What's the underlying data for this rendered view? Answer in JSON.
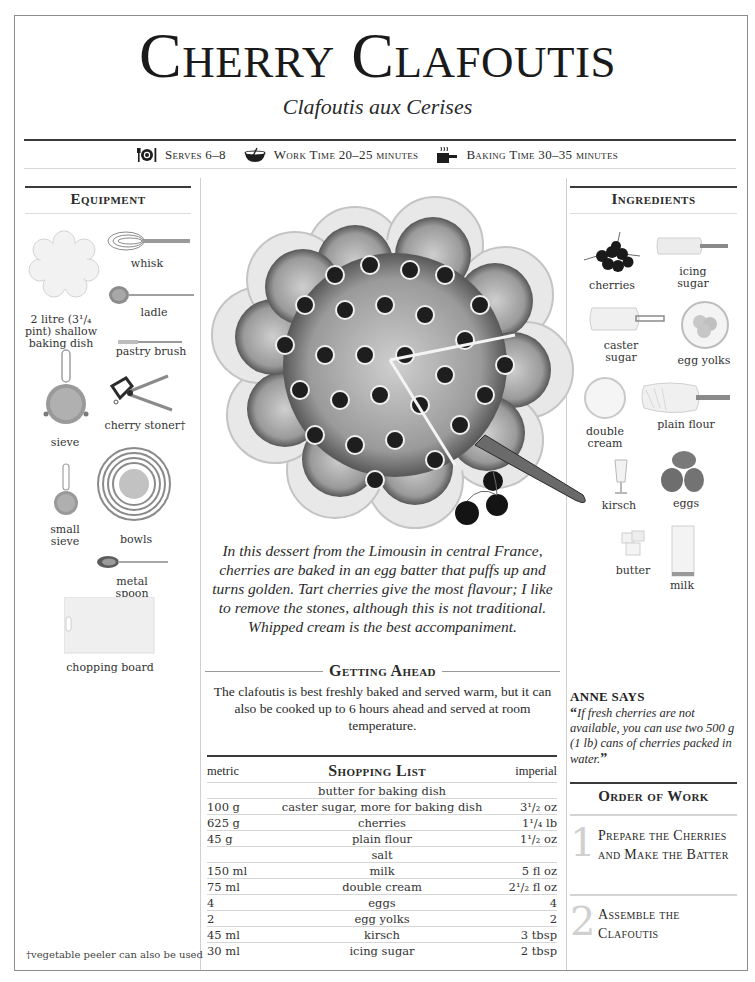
{
  "header": {
    "title": "Cherry Clafoutis",
    "subtitle": "Clafoutis aux Cerises",
    "meta": [
      {
        "icon": "place-setting-icon",
        "label": "Serves 6–8"
      },
      {
        "icon": "mixing-bowl-icon",
        "label": "Work Time 20–25 minutes"
      },
      {
        "icon": "baking-pan-icon",
        "label": "Baking Time 30–35 minutes"
      }
    ]
  },
  "equipment": {
    "heading": "Equipment",
    "items": [
      {
        "label": "whisk"
      },
      {
        "label": "ladle"
      },
      {
        "label": "2 litre (3¹/₄ pint) shallow baking dish"
      },
      {
        "label": "pastry brush"
      },
      {
        "label": "cherry stoner†"
      },
      {
        "label": "sieve"
      },
      {
        "label": "small sieve"
      },
      {
        "label": "bowls"
      },
      {
        "label": "metal spoon"
      },
      {
        "label": "chopping board"
      }
    ],
    "footnote": "†vegetable peeler can also be used"
  },
  "ingredients": {
    "heading": "Ingredients",
    "items": [
      {
        "label": "cherries"
      },
      {
        "label": "icing sugar"
      },
      {
        "label": "caster sugar"
      },
      {
        "label": "egg yolks"
      },
      {
        "label": "double cream"
      },
      {
        "label": "plain flour"
      },
      {
        "label": "kirsch"
      },
      {
        "label": "eggs"
      },
      {
        "label": "butter"
      },
      {
        "label": "milk"
      }
    ]
  },
  "intro": "In this dessert from the Limousin in central France, cherries are baked in an egg batter that puffs up and turns golden. Tart cherries give the most flavour; I like to remove the stones, although this is not traditional. Whipped cream is the best accompaniment.",
  "getting_ahead": {
    "heading": "Getting Ahead",
    "text": "The clafoutis is best freshly baked and served warm, but it can also be cooked up to 6 hours ahead and served at room temperature."
  },
  "shopping_list": {
    "heading": "Shopping List",
    "col_metric": "metric",
    "col_imperial": "imperial",
    "rows": [
      {
        "metric": "",
        "item": "butter for baking dish",
        "imperial": ""
      },
      {
        "metric": "100 g",
        "item": "caster sugar, more for baking dish",
        "imperial": "3¹/₂ oz"
      },
      {
        "metric": "625 g",
        "item": "cherries",
        "imperial": "1¹/₄ lb"
      },
      {
        "metric": "45 g",
        "item": "plain flour",
        "imperial": "1¹/₂ oz"
      },
      {
        "metric": "",
        "item": "salt",
        "imperial": ""
      },
      {
        "metric": "150 ml",
        "item": "milk",
        "imperial": "5 fl oz"
      },
      {
        "metric": "75 ml",
        "item": "double cream",
        "imperial": "2¹/₂ fl oz"
      },
      {
        "metric": "4",
        "item": "eggs",
        "imperial": "4"
      },
      {
        "metric": "2",
        "item": "egg yolks",
        "imperial": "2"
      },
      {
        "metric": "45 ml",
        "item": "kirsch",
        "imperial": "3 tbsp"
      },
      {
        "metric": "30 ml",
        "item": "icing sugar",
        "imperial": "2 tbsp"
      }
    ]
  },
  "anne_says": {
    "heading": "ANNE SAYS",
    "open_quote": "“",
    "quote": "If fresh cherries are not available, you can use two 500 g (1 lb) cans of cherries packed in water.",
    "close_quote": "”"
  },
  "order_of_work": {
    "heading": "Order of Work",
    "steps": [
      {
        "num": "1",
        "label": "Prepare the Cherries and Make the Batter"
      },
      {
        "num": "2",
        "label": "Assemble the Clafoutis"
      }
    ]
  }
}
